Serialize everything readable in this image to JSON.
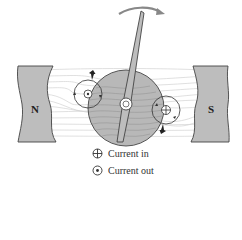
{
  "diagram": {
    "title": "",
    "magnets": [
      {
        "label": "N",
        "side": "left"
      },
      {
        "label": "S",
        "side": "right"
      }
    ],
    "legend": [
      {
        "symbol": "cross-in-circle",
        "label": "Current in"
      },
      {
        "symbol": "dot-in-circle",
        "label": "Current out"
      }
    ],
    "colors": {
      "magnet_fill": "#bdbdbd",
      "rotor_fill": "#b8b8b8",
      "field_lines": "#cfcfcf",
      "stroke": "#444444"
    }
  }
}
